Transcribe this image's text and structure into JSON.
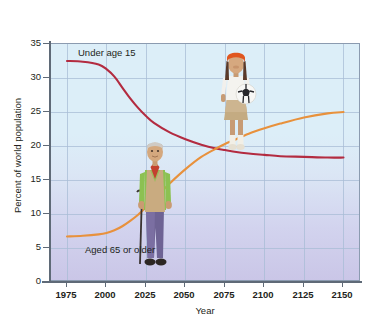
{
  "chart_data": {
    "type": "line",
    "title": "",
    "subtitle": "",
    "xlabel": "Year",
    "ylabel": "Percent of world population",
    "xlim": [
      1965,
      2160
    ],
    "ylim": [
      0,
      35
    ],
    "grid": true,
    "legend_position": "inline-annotation",
    "xticks": [
      "1975",
      "2000",
      "2025",
      "2050",
      "2075",
      "2100",
      "2125",
      "2150"
    ],
    "xtick_values": [
      1975,
      2000,
      2025,
      2050,
      2075,
      2100,
      2125,
      2150
    ],
    "yticks": [
      "0",
      "5",
      "10",
      "15",
      "20",
      "25",
      "30",
      "35"
    ],
    "ytick_values": [
      0,
      5,
      10,
      15,
      20,
      25,
      30,
      35
    ],
    "x": [
      1975,
      1985,
      1995,
      2000,
      2005,
      2010,
      2015,
      2020,
      2025,
      2030,
      2040,
      2050,
      2060,
      2070,
      2075,
      2080,
      2090,
      2100,
      2110,
      2125,
      2140,
      2150
    ],
    "series": [
      {
        "name": "Under age 15",
        "color": "#b32b40",
        "values": [
          32.5,
          32.4,
          32.0,
          31.3,
          30.2,
          28.6,
          27.0,
          25.6,
          24.4,
          23.4,
          22.0,
          21.0,
          20.2,
          19.6,
          19.4,
          19.2,
          18.9,
          18.7,
          18.5,
          18.4,
          18.3,
          18.3
        ]
      },
      {
        "name": "Aged 65 or older",
        "color": "#e8913c",
        "values": [
          6.7,
          6.8,
          7.0,
          7.2,
          7.6,
          8.2,
          9.0,
          9.9,
          11.0,
          12.2,
          14.5,
          16.6,
          18.4,
          19.7,
          20.3,
          20.8,
          21.8,
          22.6,
          23.3,
          24.2,
          24.8,
          25.0
        ]
      }
    ],
    "annotations": [
      {
        "text": "Under age 15",
        "series": "Under age 15"
      },
      {
        "text": "Aged 65 or older",
        "series": "Aged 65 or older"
      }
    ],
    "images": [
      {
        "name": "girl-with-soccer-ball",
        "alt": "Young girl holding a soccer ball"
      },
      {
        "name": "elderly-man-with-cane",
        "alt": "Elderly man standing with a cane"
      }
    ],
    "colors": {
      "under_15_line": "#b32b40",
      "over_65_line": "#e8913c",
      "plot_background_top": "#dceef8",
      "plot_background_bottom": "#cac6e7",
      "gridline": "#a8bcd6",
      "axis": "#5f6a77",
      "text": "#231f20"
    }
  }
}
